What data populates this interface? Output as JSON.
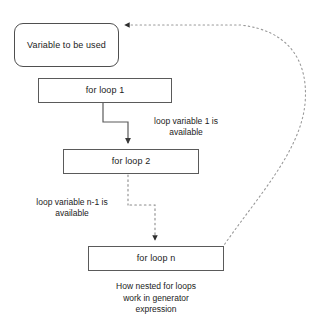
{
  "diagram": {
    "caption": "How nested for loops\nwork in generator\nexpression",
    "nodes": {
      "variable": {
        "label": "Variable to be used",
        "shape": "rounded-rectangle"
      },
      "loop1": {
        "label": "for loop 1",
        "shape": "rectangle"
      },
      "loop2": {
        "label": "for loop 2",
        "shape": "rectangle"
      },
      "loopn": {
        "label": "for loop n",
        "shape": "rectangle"
      }
    },
    "edge_labels": {
      "loop1_to_loop2": "loop variable 1 is\navailable",
      "loopn1_to_loopn": "loop variable n-1 is\navailable"
    },
    "edges": [
      {
        "from": "loop1",
        "to": "loop2",
        "style": "solid",
        "arrow": true
      },
      {
        "from": "loop2",
        "to": "loopn",
        "style": "dotted",
        "arrow": true
      },
      {
        "from": "loopn",
        "to": "variable",
        "style": "dotted",
        "arrow": true
      }
    ],
    "colors": {
      "stroke": "#5a5a5a",
      "dotted_stroke": "#8c8c8c",
      "text": "#1b1b1b",
      "background": "#ffffff"
    }
  }
}
